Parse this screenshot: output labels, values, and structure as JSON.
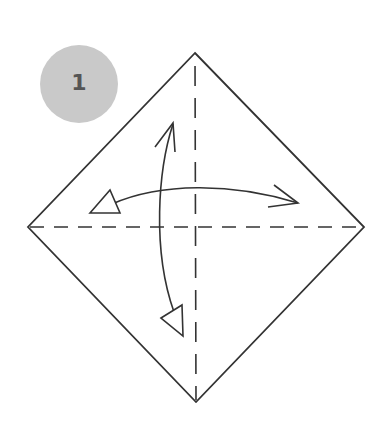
{
  "step": {
    "number": "1",
    "badge_color": "#c9c9c9",
    "number_color": "#555555"
  },
  "diagram": {
    "shape": "square-paper-diamond",
    "stroke_color": "#333333",
    "vertices": {
      "top": [
        195,
        53
      ],
      "right": [
        364,
        227
      ],
      "bottom": [
        196,
        402
      ],
      "left": [
        28,
        227
      ]
    },
    "fold_lines": [
      {
        "name": "vertical-valley-fold",
        "style": "dashed",
        "from": [
          195,
          53
        ],
        "to": [
          196,
          402
        ]
      },
      {
        "name": "horizontal-valley-fold",
        "style": "dashed",
        "from": [
          28,
          227
        ],
        "to": [
          364,
          227
        ]
      }
    ],
    "arrows": [
      {
        "name": "vertical-fold-and-unfold-arrow",
        "start_head": "open",
        "end_head": "hollow-triangle"
      },
      {
        "name": "horizontal-fold-and-unfold-arrow",
        "start_head": "hollow-triangle",
        "end_head": "open"
      }
    ]
  }
}
